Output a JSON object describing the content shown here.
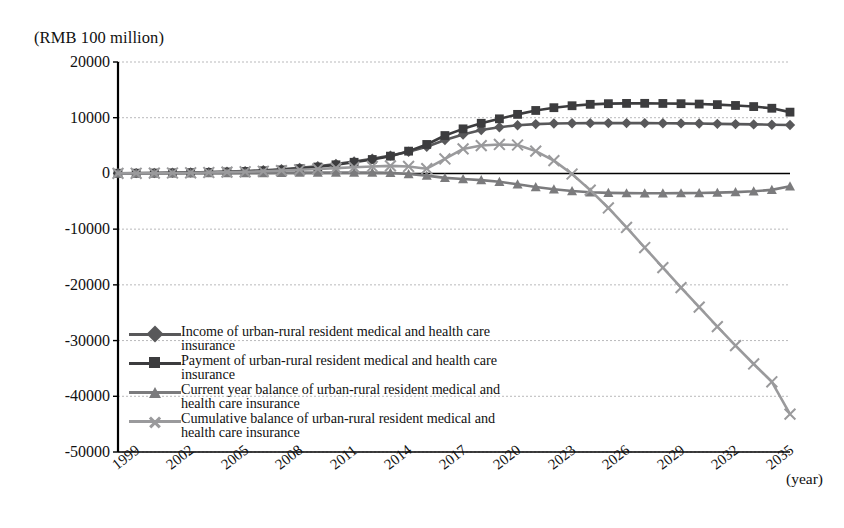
{
  "axis": {
    "y_unit_label": "(RMB 100 million)",
    "x_unit_label": "(year)",
    "y_ticks": [
      "20000",
      "10000",
      "0",
      "-10000",
      "-20000",
      "-30000",
      "-40000",
      "-50000"
    ],
    "x_ticks": [
      "1999",
      "2002",
      "2005",
      "2008",
      "2011",
      "2014",
      "2017",
      "2020",
      "2023",
      "2026",
      "2029",
      "2032",
      "2035"
    ]
  },
  "legend": {
    "items": [
      {
        "label": "Income of urban-rural resident medical and health care insurance",
        "marker": "diamond-marker",
        "color": "#58585a"
      },
      {
        "label": "Payment of urban-rural resident medical and health care insurance",
        "marker": "square-marker",
        "color": "#3c3c3e"
      },
      {
        "label": "Current year balance of urban-rural resident medical and health care insurance",
        "marker": "triangle-marker",
        "color": "#7b7b7d"
      },
      {
        "label": "Cumulative balance of urban-rural resident medical and health care insurance",
        "marker": "x-marker",
        "color": "#9a9a9c"
      }
    ]
  },
  "chart_data": {
    "type": "line",
    "title": "",
    "xlabel": "(year)",
    "ylabel": "(RMB 100 million)",
    "ylim": [
      -50000,
      20000
    ],
    "ytick_step": 10000,
    "grid": true,
    "legend_position": "inside-lower-left",
    "x": [
      1999,
      2000,
      2001,
      2002,
      2003,
      2004,
      2005,
      2006,
      2007,
      2008,
      2009,
      2010,
      2011,
      2012,
      2013,
      2014,
      2015,
      2016,
      2017,
      2018,
      2019,
      2020,
      2021,
      2022,
      2023,
      2024,
      2025,
      2026,
      2027,
      2028,
      2029,
      2030,
      2031,
      2032,
      2033,
      2034,
      2035,
      2036
    ],
    "series": [
      {
        "name": "Income of urban-rural resident medical and health care insurance",
        "marker": "diamond",
        "color": "#58585a",
        "values": [
          40,
          60,
          90,
          130,
          180,
          240,
          320,
          420,
          560,
          750,
          1000,
          1300,
          1700,
          2150,
          2650,
          3200,
          3900,
          4800,
          6000,
          7000,
          7800,
          8300,
          8650,
          8850,
          8950,
          9000,
          9020,
          9030,
          9030,
          9020,
          9000,
          8980,
          8950,
          8900,
          8850,
          8800,
          8750,
          8700
        ]
      },
      {
        "name": "Payment of urban-rural resident medical and health care insurance",
        "marker": "square",
        "color": "#3c3c3e",
        "values": [
          30,
          45,
          70,
          100,
          140,
          190,
          260,
          350,
          470,
          630,
          850,
          1150,
          1550,
          2000,
          2500,
          3100,
          4000,
          5200,
          6800,
          8000,
          9000,
          9800,
          10600,
          11300,
          11800,
          12150,
          12400,
          12520,
          12570,
          12580,
          12560,
          12520,
          12450,
          12350,
          12200,
          12000,
          11700,
          11000
        ]
      },
      {
        "name": "Current year balance of urban-rural resident medical and health care insurance",
        "marker": "triangle",
        "color": "#7b7b7d",
        "values": [
          10,
          15,
          20,
          30,
          40,
          50,
          60,
          70,
          90,
          120,
          150,
          150,
          150,
          150,
          150,
          100,
          -100,
          -400,
          -800,
          -1000,
          -1200,
          -1500,
          -1950,
          -2450,
          -2850,
          -3150,
          -3380,
          -3490,
          -3540,
          -3560,
          -3560,
          -3540,
          -3500,
          -3450,
          -3350,
          -3200,
          -2950,
          -2300
        ]
      },
      {
        "name": "Cumulative balance of urban-rural resident medical and health care insurance",
        "marker": "x",
        "color": "#9a9a9c",
        "values": [
          10,
          25,
          45,
          75,
          115,
          165,
          225,
          295,
          385,
          505,
          655,
          805,
          955,
          1105,
          1255,
          1355,
          1255,
          855,
          2600,
          4400,
          5000,
          5200,
          5100,
          4000,
          2300,
          -100,
          -3000,
          -6200,
          -9700,
          -13300,
          -16900,
          -20500,
          -24000,
          -27500,
          -30900,
          -34200,
          -37400,
          -43200
        ]
      }
    ]
  }
}
